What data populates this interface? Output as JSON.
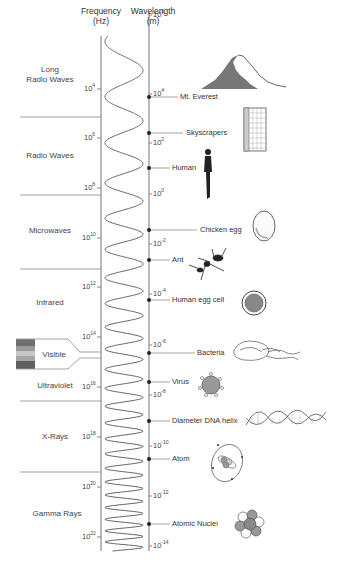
{
  "headers": {
    "frequency": "Frequency",
    "frequency_unit": "(Hz)",
    "wavelength": "Wavelength",
    "wavelength_unit": "(m)"
  },
  "bands": [
    {
      "id": "long-radio",
      "line1": "Long",
      "line2": "Radio Waves"
    },
    {
      "id": "radio",
      "line1": "Radio Waves"
    },
    {
      "id": "microwaves",
      "line1": "Microwaves"
    },
    {
      "id": "infrared",
      "line1": "Infrared"
    },
    {
      "id": "visible",
      "line1": "Visible"
    },
    {
      "id": "ultraviolet",
      "line1": "Ultraviolet"
    },
    {
      "id": "x-rays",
      "line1": "X-Rays"
    },
    {
      "id": "gamma",
      "line1": "Gamma Rays"
    }
  ],
  "frequency_ticks": [
    {
      "base": "10",
      "exp": "4"
    },
    {
      "base": "10",
      "exp": "6"
    },
    {
      "base": "10",
      "exp": "8"
    },
    {
      "base": "10",
      "exp": "10"
    },
    {
      "base": "10",
      "exp": "12"
    },
    {
      "base": "10",
      "exp": "14"
    },
    {
      "base": "10",
      "exp": "16"
    },
    {
      "base": "10",
      "exp": "18"
    },
    {
      "base": "10",
      "exp": "20"
    },
    {
      "base": "10",
      "exp": "22"
    }
  ],
  "wavelength_ticks": [
    {
      "base": "10",
      "exp": "6"
    },
    {
      "base": "10",
      "exp": "4"
    },
    {
      "base": "10",
      "exp": "2"
    },
    {
      "base": "10",
      "exp": "0"
    },
    {
      "base": "10",
      "exp": "-2"
    },
    {
      "base": "10",
      "exp": "-4"
    },
    {
      "base": "10",
      "exp": "-6"
    },
    {
      "base": "10",
      "exp": "-8"
    },
    {
      "base": "10",
      "exp": "-10"
    },
    {
      "base": "10",
      "exp": "-12"
    },
    {
      "base": "10",
      "exp": "-14"
    }
  ],
  "objects": [
    {
      "label": "Mt. Everest",
      "icon": "mountain-icon"
    },
    {
      "label": "Skyscrapers",
      "icon": "skyscraper-icon"
    },
    {
      "label": "Human",
      "icon": "human-icon"
    },
    {
      "label": "Chicken egg",
      "icon": "egg-icon"
    },
    {
      "label": "Ant",
      "icon": "ant-icon"
    },
    {
      "label": "Human egg cell",
      "icon": "egg-cell-icon"
    },
    {
      "label": "Bacteria",
      "icon": "bacteria-icon"
    },
    {
      "label": "Virus",
      "icon": "virus-icon"
    },
    {
      "label": "Diameter DNA helix",
      "icon": "dna-helix-icon"
    },
    {
      "label": "Atom",
      "icon": "atom-icon"
    },
    {
      "label": "Atomic Nuclei",
      "icon": "nucleus-icon"
    }
  ],
  "colors": {
    "line": "#8a8a8a",
    "text": "#333333",
    "fill_dark": "#7a7a7a",
    "fill_light": "#bdbdbd"
  }
}
